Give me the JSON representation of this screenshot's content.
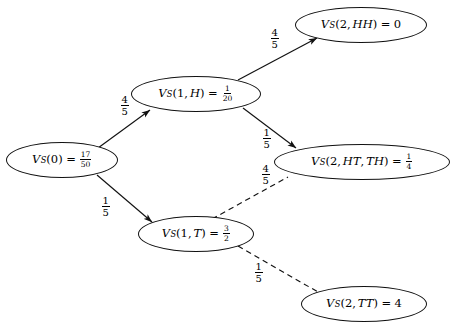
{
  "diagram": {
    "background_color": "#ffffff",
    "stroke_color": "#111111",
    "nodes": [
      {
        "id": "v0",
        "name": "node-vs-0",
        "var": "V",
        "subscript": "S",
        "args": "(0)",
        "equals": "=",
        "value_numer": "17",
        "value_denom": "50",
        "value_plain": "17/50",
        "full_text": "V_S(0) = 17/50",
        "cx": 62,
        "cy": 160,
        "rx": 56,
        "ry": 18
      },
      {
        "id": "v1h",
        "name": "node-vs-1-h",
        "var": "V",
        "subscript": "S",
        "args": "(1, H)",
        "equals": "=",
        "value_numer": "1",
        "value_denom": "20",
        "value_plain": "1/20",
        "full_text": "V_S(1, H) = 1/20",
        "cx": 196,
        "cy": 94,
        "rx": 65,
        "ry": 18
      },
      {
        "id": "v1t",
        "name": "node-vs-1-t",
        "var": "V",
        "subscript": "S",
        "args": "(1, T)",
        "equals": "=",
        "value_numer": "3",
        "value_denom": "2",
        "value_plain": "3/2",
        "full_text": "V_S(1, T) = 3/2",
        "cx": 196,
        "cy": 234,
        "rx": 58,
        "ry": 18
      },
      {
        "id": "v2hh",
        "name": "node-vs-2-hh",
        "var": "V",
        "subscript": "S",
        "args": "(2, HH)",
        "equals": "=",
        "value_numer": "",
        "value_denom": "",
        "value_plain": "0",
        "full_text": "V_S(2, HH) = 0",
        "cx": 361,
        "cy": 25,
        "rx": 66,
        "ry": 18
      },
      {
        "id": "v2htth",
        "name": "node-vs-2-ht-th",
        "var": "V",
        "subscript": "S",
        "args": "(2, HT, TH)",
        "equals": "=",
        "value_numer": "1",
        "value_denom": "4",
        "value_plain": "1/4",
        "full_text": "V_S(2, HT, TH) = 1/4",
        "cx": 362,
        "cy": 162,
        "rx": 88,
        "ry": 18
      },
      {
        "id": "v2tt",
        "name": "node-vs-2-tt",
        "var": "V",
        "subscript": "S",
        "args": "(2, TT)",
        "equals": "=",
        "value_numer": "",
        "value_denom": "",
        "value_plain": "4",
        "full_text": "V_S(2, TT) = 4",
        "cx": 364,
        "cy": 304,
        "rx": 63,
        "ry": 18
      }
    ],
    "edges": [
      {
        "id": "e-v0-v1h",
        "name": "edge-vs0-to-vs1h",
        "from": "v0",
        "to": "v1h",
        "style": "solid",
        "arrow": true,
        "x1": 98,
        "y1": 148,
        "x2": 150,
        "y2": 110,
        "label_numer": "4",
        "label_denom": "5",
        "label_plain": "4/5",
        "label_x": 120,
        "label_y": 95
      },
      {
        "id": "e-v1h-v2hh",
        "name": "edge-vs1h-to-vs2hh",
        "from": "v1h",
        "to": "v2hh",
        "style": "solid",
        "arrow": true,
        "x1": 238,
        "y1": 80,
        "x2": 317,
        "y2": 38,
        "label_numer": "4",
        "label_denom": "5",
        "label_plain": "4/5",
        "label_x": 270,
        "label_y": 28
      },
      {
        "id": "e-v1h-v2htth",
        "name": "edge-vs1h-to-vs2htth",
        "from": "v1h",
        "to": "v2htth",
        "style": "solid",
        "arrow": true,
        "x1": 243,
        "y1": 108,
        "x2": 296,
        "y2": 148,
        "label_numer": "1",
        "label_denom": "5",
        "label_plain": "1/5",
        "label_x": 262,
        "label_y": 128
      },
      {
        "id": "e-v0-v1t",
        "name": "edge-vs0-to-vs1t",
        "from": "v0",
        "to": "v1t",
        "style": "solid",
        "arrow": true,
        "x1": 97,
        "y1": 175,
        "x2": 152,
        "y2": 222,
        "label_numer": "1",
        "label_denom": "5",
        "label_plain": "1/5",
        "label_x": 101,
        "label_y": 196
      },
      {
        "id": "e-v1t-v2htth",
        "name": "edge-vs1t-to-vs2htth",
        "from": "v1t",
        "to": "v2htth",
        "style": "dashed",
        "arrow": false,
        "x1": 212,
        "y1": 219,
        "x2": 288,
        "y2": 177,
        "label_numer": "4",
        "label_denom": "5",
        "label_plain": "4/5",
        "label_x": 261,
        "label_y": 164
      },
      {
        "id": "e-v1t-v2tt",
        "name": "edge-vs1t-to-vs2tt",
        "from": "v1t",
        "to": "v2tt",
        "style": "dashed",
        "arrow": false,
        "x1": 238,
        "y1": 246,
        "x2": 318,
        "y2": 292,
        "label_numer": "1",
        "label_denom": "5",
        "label_plain": "1/5",
        "label_x": 254,
        "label_y": 262
      }
    ]
  }
}
